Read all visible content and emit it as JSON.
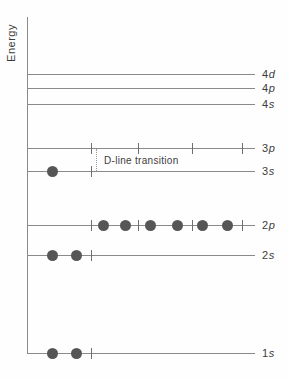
{
  "diagram": {
    "type": "energy-level-diagram",
    "axis": {
      "label": "Energy",
      "x": 27,
      "y_top": 17,
      "y_bottom": 353
    },
    "line": {
      "x_start": 27,
      "x_end": 255,
      "color": "#8a8a8a"
    },
    "label_x": 262,
    "electron_color": "#565656",
    "electron_diameter": 11,
    "levels": [
      {
        "name": "4d",
        "number": "4",
        "letter": "d",
        "y": 74,
        "ticks": [],
        "electrons": []
      },
      {
        "name": "4p",
        "number": "4",
        "letter": "p",
        "y": 88,
        "ticks": [],
        "electrons": []
      },
      {
        "name": "4s",
        "number": "4",
        "letter": "s",
        "y": 104,
        "ticks": [],
        "electrons": []
      },
      {
        "name": "3p",
        "number": "3",
        "letter": "p",
        "y": 148,
        "ticks": [
          91,
          138,
          192,
          242
        ],
        "electrons": []
      },
      {
        "name": "3s",
        "number": "3",
        "letter": "s",
        "y": 171,
        "ticks": [
          91
        ],
        "electrons": [
          52
        ]
      },
      {
        "name": "2p",
        "number": "2",
        "letter": "p",
        "y": 225,
        "ticks": [
          91,
          138,
          192,
          242
        ],
        "electrons": [
          103,
          125,
          150,
          177,
          202,
          227
        ]
      },
      {
        "name": "2s",
        "number": "2",
        "letter": "s",
        "y": 255,
        "ticks": [
          91
        ],
        "electrons": [
          52,
          76
        ]
      },
      {
        "name": "1s",
        "number": "1",
        "letter": "s",
        "y": 353,
        "ticks": [
          91
        ],
        "electrons": [
          52,
          76
        ]
      }
    ],
    "annotation": {
      "label": "D-line transition",
      "dotted_line": {
        "x": 96,
        "y_top": 149,
        "y_bottom": 171
      }
    }
  }
}
